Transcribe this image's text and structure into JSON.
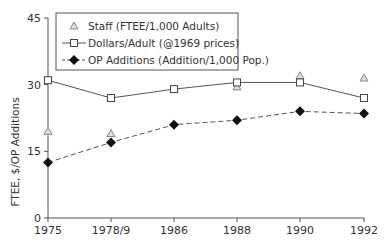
{
  "chart_data": {
    "type": "line",
    "title": "",
    "xlabel": "",
    "ylabel": "FTEE, $/OP Additions",
    "ylim": [
      0,
      45
    ],
    "yticks": [
      0,
      15,
      30,
      45
    ],
    "grid": false,
    "legend_position": "top-left inside",
    "categories": [
      "1975",
      "1978/9",
      "1986",
      "1988",
      "1990",
      "1992"
    ],
    "series": [
      {
        "name": "Staff (FTEE/1,000 Adults)",
        "marker": "triangle",
        "line": "none",
        "color": "#888888",
        "values": [
          19.5,
          19,
          29,
          29.5,
          32,
          31.5
        ]
      },
      {
        "name": "Dollars/Adult (@1969 prices)",
        "marker": "open-square",
        "line": "solid",
        "color": "#444444",
        "values": [
          31,
          27,
          29,
          30.5,
          30.5,
          27
        ]
      },
      {
        "name": "OP Additions (Addition/1,000 Pop.)",
        "marker": "filled-diamond",
        "line": "dashed",
        "color": "#111111",
        "values": [
          12.5,
          17,
          21,
          22,
          24,
          23.5
        ]
      }
    ]
  }
}
